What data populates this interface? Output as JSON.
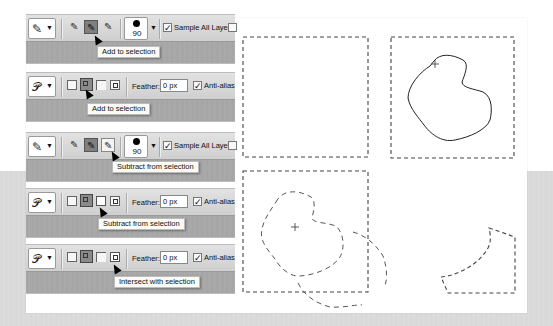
{
  "panels": [
    {
      "tool": "quick-selection",
      "tool_icon": "quick-selection-brush-icon",
      "mode_buttons": [
        "new-selection",
        "add-to-selection",
        "subtract-from-selection"
      ],
      "active_mode": "add-to-selection",
      "brush_size": "90",
      "sample_all_layers_label": "Sample All Layers",
      "sample_all_layers_checked": true,
      "tooltip": "Add to selection"
    },
    {
      "tool": "lasso",
      "tool_icon": "lasso-icon",
      "mode_buttons": [
        "new-selection",
        "add-to-selection",
        "subtract-from-selection",
        "intersect-with-selection"
      ],
      "active_mode": "add-to-selection",
      "feather_label": "Feather:",
      "feather_value": "0 px",
      "anti_alias_label": "Anti-alias",
      "anti_alias_checked": true,
      "tooltip": "Add to selection"
    },
    {
      "tool": "quick-selection",
      "tool_icon": "quick-selection-brush-icon",
      "mode_buttons": [
        "new-selection",
        "add-to-selection",
        "subtract-from-selection"
      ],
      "active_mode": "add-to-selection",
      "hover_mode": "subtract-from-selection",
      "brush_size": "90",
      "sample_all_layers_label": "Sample All Layers",
      "sample_all_layers_checked": true,
      "tooltip": "Subtract from selection"
    },
    {
      "tool": "lasso",
      "tool_icon": "lasso-icon",
      "mode_buttons": [
        "new-selection",
        "add-to-selection",
        "subtract-from-selection",
        "intersect-with-selection"
      ],
      "active_mode": "add-to-selection",
      "hover_mode": "subtract-from-selection",
      "feather_label": "Feather:",
      "feather_value": "0 px",
      "anti_alias_label": "Anti-alias",
      "anti_alias_checked": true,
      "tooltip": "Subtract from selection"
    },
    {
      "tool": "lasso",
      "tool_icon": "lasso-icon",
      "mode_buttons": [
        "new-selection",
        "add-to-selection",
        "subtract-from-selection",
        "intersect-with-selection"
      ],
      "active_mode": "add-to-selection",
      "hover_mode": "intersect-with-selection",
      "feather_label": "Feather:",
      "feather_value": "0 px",
      "anti_alias_label": "Anti-alias",
      "anti_alias_checked": true,
      "tooltip": "Intersect with selection"
    }
  ],
  "illustrations": [
    {
      "name": "rectangular-marquee-selection",
      "description": "dashed rectangle selection"
    },
    {
      "name": "add-lasso-selection",
      "description": "rectangle plus lasso shape being added"
    },
    {
      "name": "subtract-selection",
      "description": "rectangle with shape subtracted, dashed marching ants"
    },
    {
      "name": "intersect-selection",
      "description": "resulting intersected region"
    }
  ],
  "colors": {
    "options_bar": "#d8d8d8",
    "under_bar": "#a8a8a8",
    "tooltip_bg": "#fbfbf6",
    "background_band": "#dadada"
  }
}
